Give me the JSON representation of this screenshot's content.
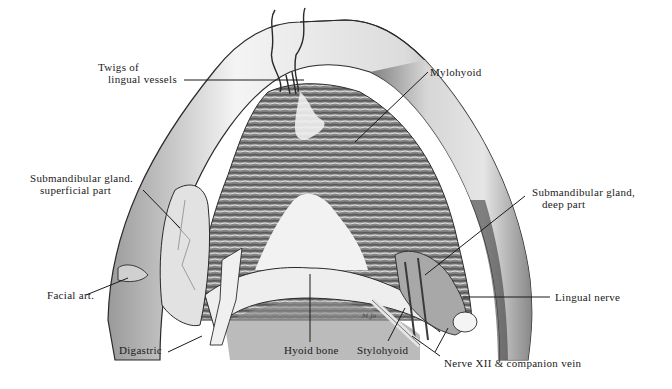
{
  "figure": {
    "signature": "M Jo",
    "colors": {
      "ink": "#1a1a1a",
      "bone": "#e4e4e4",
      "muscle": "#7a7a7a",
      "background": "#ffffff"
    }
  },
  "labels": {
    "twigs": {
      "line1": "Twigs of",
      "line2": "lingual vessels"
    },
    "mylohyoid": "Mylohyoid",
    "submandibular_superficial": {
      "line1": "Submandibular gland.",
      "line2": "superficial part"
    },
    "submandibular_deep": {
      "line1": "Submandibular gland,",
      "line2": "deep part"
    },
    "facial_art": "Facial art.",
    "lingual_nerve": "Lingual nerve",
    "digastric": "Digastric",
    "hyoid_bone": "Hyoid bone",
    "stylohyoid": "Stylohyoid",
    "nerve_xii": "Nerve XII & companion vein"
  }
}
